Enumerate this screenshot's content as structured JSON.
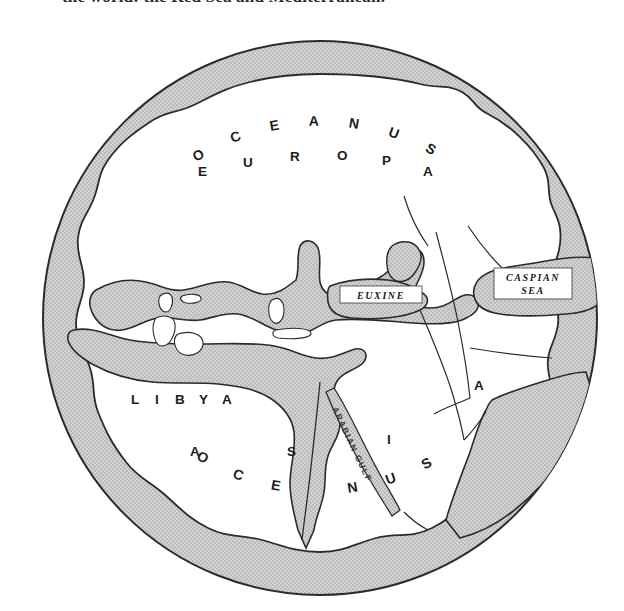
{
  "page": {
    "caption_cutoff": "the world: the Red Sea and Mediterranean.",
    "background": "#ffffff"
  },
  "map": {
    "type": "classical-world-map",
    "ocean_ring": {
      "label_top": "O C E A N U S",
      "label_bottom": "O C E A N U S",
      "fill": "#c9c9c9",
      "stroke": "#2b2b2b"
    },
    "landmass": {
      "fill": "#c9c9c9",
      "stroke": "#2b2b2b",
      "sea_fill": "#ffffff"
    },
    "continents": [
      {
        "name": "EUROPA",
        "letters": [
          "E",
          "U",
          "R",
          "O",
          "P",
          "A"
        ]
      },
      {
        "name": "LIBYA",
        "letters": [
          "L",
          "I",
          "B",
          "Y",
          "A"
        ]
      },
      {
        "name": "ASIA",
        "letters": [
          "A",
          "S",
          "I",
          "A"
        ]
      }
    ],
    "seas": [
      {
        "name": "EUXINE",
        "lines": [
          "EUXINE"
        ]
      },
      {
        "name": "CASPIAN SEA",
        "lines": [
          "CASPIAN",
          "SEA"
        ]
      }
    ],
    "gulfs": [
      {
        "name": "ARABIAN GULF",
        "text": "ARABIAN GULF"
      }
    ],
    "geometry": {
      "center_x": 320,
      "center_y": 318,
      "outer_radius": 278,
      "inner_radius": 248
    }
  }
}
